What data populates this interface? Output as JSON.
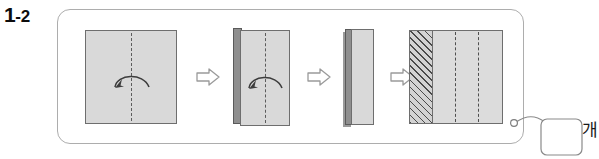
{
  "step": {
    "number": "1",
    "separator": "-",
    "sub_number": "2",
    "full_label": "1-2"
  },
  "panel": {
    "name": "instruction-panel",
    "border_color": "#adadad",
    "background": "#ffffff"
  },
  "colors": {
    "paper_fill": "#d9d9d9",
    "paper_edge": "#6e6e6e",
    "spine_fill": "#8f8f8f",
    "fold_line": "#5c5c5c",
    "hatch_line": "#4a4a4a",
    "arrow_outline": "#9a9a9a",
    "text": "#0d0d0d"
  },
  "steps": [
    {
      "id": "step-1",
      "icon_name": "paper-square-with-fold-line",
      "shape": "square",
      "fold_line": "vertical-center-dashed",
      "fold_arrow": "curved-arrow-right-to-left",
      "hatched": false
    },
    {
      "id": "step-2",
      "icon_name": "paper-folded-half-with-fold-line",
      "shape": "tall-rectangle",
      "fold_line": "vertical-center-dashed",
      "fold_arrow": "curved-arrow-right-to-left",
      "hatched": false
    },
    {
      "id": "step-3",
      "icon_name": "paper-folded-quarter",
      "shape": "narrow-tall-rectangle",
      "fold_line": "none",
      "fold_arrow": "none",
      "hatched": false
    },
    {
      "id": "step-4",
      "icon_name": "paper-square-hatched-with-two-fold-lines",
      "shape": "square",
      "fold_line": "two-vertical-dashed",
      "fold_arrow": "none",
      "hatched": true
    }
  ],
  "separators": [
    {
      "id": "arrow-1",
      "icon_name": "arrow-right-outline"
    },
    {
      "id": "arrow-2",
      "icon_name": "arrow-right-outline"
    },
    {
      "id": "arrow-3",
      "icon_name": "arrow-right-outline"
    }
  ],
  "connector": {
    "icon_name": "connector-nodes",
    "node_count": 2,
    "box_name": "connector-box",
    "label": "개"
  }
}
